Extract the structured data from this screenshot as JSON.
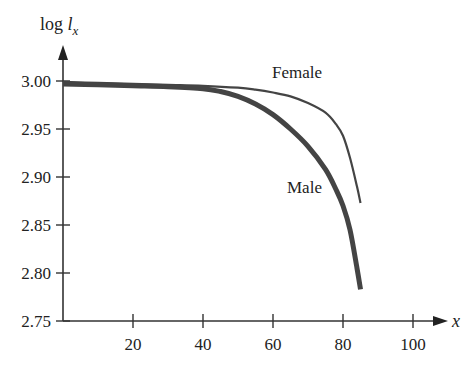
{
  "chart_data": {
    "type": "line",
    "title": "",
    "xlabel": "x",
    "ylabel": "log l_x",
    "ylabel_parts": {
      "prefix": "log ",
      "var": "l",
      "sub": "x"
    },
    "xlim": [
      0,
      110
    ],
    "ylim": [
      2.75,
      3.0
    ],
    "x_ticks": [
      20,
      40,
      60,
      80,
      100
    ],
    "x_tick_labels": [
      "20",
      "40",
      "60",
      "80",
      "100"
    ],
    "y_ticks": [
      2.75,
      2.8,
      2.85,
      2.9,
      2.95,
      3.0
    ],
    "y_tick_labels": [
      "2.75",
      "2.80",
      "2.85",
      "2.90",
      "2.95",
      "3.00"
    ],
    "grid": false,
    "legend": "inline labels",
    "series": [
      {
        "name": "Female",
        "label": "Female",
        "line_weight": "thin",
        "color": "#444444",
        "x": [
          0,
          10,
          20,
          30,
          40,
          50,
          55,
          60,
          65,
          70,
          75,
          78,
          80,
          82,
          84,
          85
        ],
        "y": [
          2.999,
          2.998,
          2.997,
          2.996,
          2.995,
          2.993,
          2.991,
          2.988,
          2.984,
          2.977,
          2.967,
          2.955,
          2.943,
          2.92,
          2.89,
          2.873
        ]
      },
      {
        "name": "Male",
        "label": "Male",
        "line_weight": "thick",
        "color": "#444444",
        "x": [
          0,
          10,
          20,
          30,
          40,
          45,
          50,
          55,
          60,
          65,
          70,
          75,
          78,
          80,
          82,
          84,
          85
        ],
        "y": [
          2.997,
          2.996,
          2.995,
          2.994,
          2.992,
          2.989,
          2.984,
          2.976,
          2.965,
          2.95,
          2.932,
          2.908,
          2.887,
          2.87,
          2.845,
          2.805,
          2.783
        ]
      }
    ]
  },
  "labels": {
    "y_axis_prefix": "log ",
    "y_axis_var": "l",
    "y_axis_sub": "x",
    "x_axis": "x",
    "female": "Female",
    "male": "Male"
  }
}
